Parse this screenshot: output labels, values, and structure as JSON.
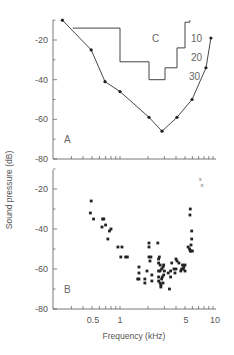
{
  "chart_data": [
    {
      "panel": "A",
      "type": "line",
      "xscale": "log",
      "xlim": [
        0.2,
        11
      ],
      "ylim": [
        -80,
        -10
      ],
      "yticks": [
        -20,
        -40,
        -60,
        -80
      ],
      "series": [
        {
          "name": "Audiogram (curve A)",
          "x": [
            0.24,
            0.49,
            0.69,
            1.0,
            2.05,
            2.83,
            4.1,
            5.95,
            8.4,
            9.5
          ],
          "y": [
            -10,
            -25,
            -41,
            -46,
            -59,
            -66,
            -59,
            -50,
            -34,
            -19
          ]
        },
        {
          "name": "Threshold C (step)",
          "type": "step",
          "x": [
            0.31,
            1.0,
            1.0,
            2.05,
            2.05,
            3.05,
            3.05,
            4.1,
            4.1,
            5.0,
            5.0,
            5.65,
            5.65
          ],
          "y": [
            -14,
            -14,
            -31,
            -31,
            -40,
            -40,
            -34,
            -34,
            -24,
            -24,
            -11,
            -11,
            -10
          ]
        }
      ],
      "annotations": [
        {
          "text": "C"
        },
        {
          "text": "10"
        },
        {
          "text": "20"
        },
        {
          "text": "30"
        },
        {
          "text": "A"
        }
      ]
    },
    {
      "panel": "B",
      "type": "scatter",
      "xscale": "log",
      "xlim": [
        0.2,
        11
      ],
      "ylim": [
        -80,
        -10
      ],
      "yticks": [
        -20,
        -40,
        -60,
        -80
      ],
      "xticks": [
        0.5,
        1,
        5,
        10
      ],
      "series": [
        {
          "name": "Individual thresholds",
          "points": [
            [
              0.49,
              -26
            ],
            [
              0.48,
              -32
            ],
            [
              0.52,
              -35
            ],
            [
              0.65,
              -35
            ],
            [
              0.67,
              -35
            ],
            [
              0.64,
              -39
            ],
            [
              0.7,
              -38
            ],
            [
              0.77,
              -41
            ],
            [
              0.8,
              -40
            ],
            [
              0.74,
              -45
            ],
            [
              0.95,
              -49
            ],
            [
              1.05,
              -49
            ],
            [
              1.02,
              -54
            ],
            [
              1.15,
              -54
            ],
            [
              1.2,
              -54
            ],
            [
              1.6,
              -59
            ],
            [
              1.6,
              -62
            ],
            [
              1.55,
              -65
            ],
            [
              1.6,
              -65
            ],
            [
              1.85,
              -65
            ],
            [
              1.85,
              -67
            ],
            [
              1.95,
              -61
            ],
            [
              2.05,
              -47
            ],
            [
              2.05,
              -49
            ],
            [
              2.05,
              -54
            ],
            [
              2.1,
              -56
            ],
            [
              2.15,
              -54
            ],
            [
              2.2,
              -63
            ],
            [
              2.2,
              -66
            ],
            [
              2.55,
              -47
            ],
            [
              2.6,
              -55
            ],
            [
              2.6,
              -57
            ],
            [
              2.65,
              -54
            ],
            [
              2.7,
              -58
            ],
            [
              2.6,
              -61
            ],
            [
              2.7,
              -61
            ],
            [
              2.8,
              -60
            ],
            [
              2.9,
              -59
            ],
            [
              2.95,
              -58
            ],
            [
              2.6,
              -64
            ],
            [
              2.6,
              -66
            ],
            [
              2.7,
              -67
            ],
            [
              2.75,
              -68
            ],
            [
              2.8,
              -65
            ],
            [
              2.85,
              -64
            ],
            [
              2.9,
              -67
            ],
            [
              2.75,
              -69
            ],
            [
              2.95,
              -63
            ],
            [
              3.0,
              -61
            ],
            [
              3.3,
              -62
            ],
            [
              3.5,
              -64
            ],
            [
              3.5,
              -61
            ],
            [
              3.6,
              -57
            ],
            [
              3.4,
              -70
            ],
            [
              3.8,
              -60
            ],
            [
              3.9,
              -62
            ],
            [
              4.0,
              -60
            ],
            [
              4.0,
              -55
            ],
            [
              4.1,
              -56
            ],
            [
              4.3,
              -57
            ],
            [
              4.5,
              -61
            ],
            [
              4.6,
              -60
            ],
            [
              4.7,
              -58
            ],
            [
              4.8,
              -60
            ],
            [
              4.85,
              -59
            ],
            [
              5.0,
              -61
            ],
            [
              5.0,
              -58
            ],
            [
              5.4,
              -49
            ],
            [
              5.6,
              -50
            ],
            [
              5.7,
              -51
            ],
            [
              5.8,
              -48
            ],
            [
              5.8,
              -51
            ],
            [
              5.9,
              -45
            ],
            [
              5.9,
              -41
            ],
            [
              5.65,
              -33
            ],
            [
              5.7,
              -30
            ],
            [
              6.0,
              -51
            ]
          ]
        },
        {
          "name": "Out of range (x marks)",
          "points": [
            [
              7.3,
              -15
            ],
            [
              7.6,
              -18
            ]
          ]
        }
      ],
      "annotations": [
        {
          "text": "B"
        }
      ]
    }
  ],
  "labels": {
    "ylabel": "Sound pressure (dB)",
    "xlabel": "Frequency (kHz)",
    "panel_a": "A",
    "panel_b": "B",
    "curve_c": "C",
    "curve_10": "10",
    "curve_20": "20",
    "curve_30": "30",
    "ytick_20": "-20",
    "ytick_40": "-40",
    "ytick_60": "-60",
    "ytick_80": "-80",
    "xtick_05": "0.5",
    "xtick_1": "1",
    "xtick_5": "5",
    "xtick_10": "10"
  }
}
